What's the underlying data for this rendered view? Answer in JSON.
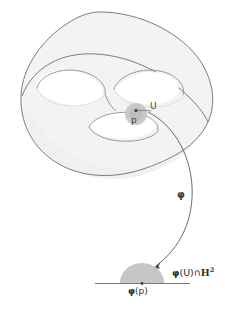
{
  "figure": {
    "background_color": "#ffffff",
    "surface": {
      "name": "genus-2-surface",
      "fill_color": "#f2f2f2",
      "stroke_color": "#6b6b6b",
      "hidden_stroke_color": "#bdbdbd"
    },
    "neighborhood": {
      "label": "U",
      "fill_color": "#c4c4c4",
      "point_label": "p",
      "point_color": "#444444"
    },
    "map": {
      "label": "φ",
      "arrow_color": "#555555"
    },
    "image_region": {
      "label_phi": "φ",
      "label_open": "(U)",
      "label_cap": "∩",
      "label_halfplane": "H",
      "label_exponent": "2",
      "fill_color": "#c4c4c4",
      "boundary_line_color": "#7a7a7a"
    },
    "image_point": {
      "label_phi": "φ",
      "label_arg": "(p)",
      "point_color": "#444444"
    }
  }
}
